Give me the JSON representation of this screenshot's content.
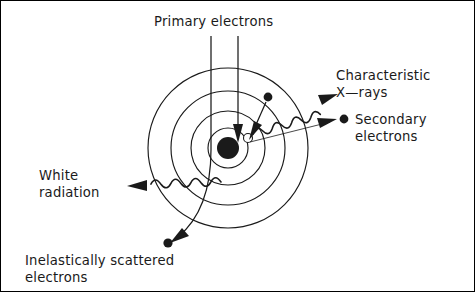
{
  "figure": {
    "title_text": "Electron beam interactions with an atom",
    "background": "#ffffff",
    "ink_color": "#1a1a1a",
    "width": 475,
    "height": 292
  },
  "labels": {
    "primary_electrons": "Primary electrons",
    "characteristic_line1": "Characteristic",
    "characteristic_line2": "X—rays",
    "secondary_line1": "Secondary",
    "secondary_line2": "electrons",
    "white_line1": "White",
    "white_line2": "radiation",
    "inelastic_line1": "Inelastically scattered",
    "inelastic_line2": "electrons"
  },
  "atom": {
    "center_x": 228,
    "center_y": 148,
    "shell_radii": [
      20,
      37,
      57,
      80
    ],
    "shell_count": 4,
    "nucleus_radius": 11,
    "nucleus_cx": 228,
    "nucleus_cy": 148,
    "vacancy_radius": 4.5,
    "vacancy_cx": 248,
    "vacancy_cy": 138
  },
  "particles": {
    "inner_shell_electron": {
      "cx": 268,
      "cy": 97,
      "r": 4.4
    },
    "secondary_electron_marker": {
      "cx": 344,
      "cy": 119,
      "r": 4.4
    },
    "scattered_electron": {
      "cx": 168,
      "cy": 243,
      "r": 4.6
    }
  },
  "beams": {
    "primary_left_x": 211,
    "primary_right_x": 238,
    "primary_top_y": 36
  },
  "icons": {
    "arrowhead": "arrowhead-icon",
    "wavy_photon": "wavy-photon-icon",
    "electron_dot": "electron-dot-icon",
    "nucleus": "nucleus-icon",
    "vacancy": "vacancy-icon"
  }
}
